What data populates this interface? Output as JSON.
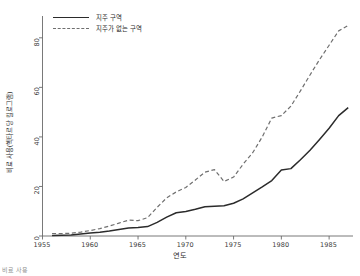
{
  "figure": {
    "background": "#ffffff",
    "footnote": "비료 사용"
  },
  "chart_data": {
    "type": "line",
    "title": "",
    "xlabel": "연도",
    "ylabel": "비료 사용(헥타르당 킬로그램)",
    "xlim": [
      1955,
      1987.5
    ],
    "ylim": [
      0,
      88
    ],
    "xticks": [
      "1955",
      "1960",
      "1965",
      "1970",
      "1975",
      "1980",
      "1985"
    ],
    "xtick_values": [
      1955,
      1960,
      1965,
      1970,
      1975,
      1980,
      1985
    ],
    "yticks": [
      "0",
      "20",
      "40",
      "60",
      "80"
    ],
    "ytick_values": [
      0,
      20,
      40,
      60,
      80
    ],
    "grid": false,
    "legend_position": "top-left",
    "x": [
      1956,
      1957,
      1958,
      1959,
      1960,
      1961,
      1962,
      1963,
      1964,
      1965,
      1966,
      1967,
      1968,
      1969,
      1970,
      1971,
      1972,
      1973,
      1974,
      1975,
      1976,
      1977,
      1978,
      1979,
      1980,
      1981,
      1982,
      1983,
      1984,
      1985,
      1986,
      1987
    ],
    "series": [
      {
        "name": "지주 구역",
        "style": "solid",
        "color": "#2b2b2b",
        "values": [
          0.2,
          0.3,
          0.4,
          0.8,
          1.2,
          1.5,
          2.0,
          2.6,
          3.2,
          3.4,
          3.8,
          5.5,
          7.6,
          9.4,
          9.9,
          10.8,
          11.8,
          12.0,
          12.2,
          13.2,
          15.0,
          17.4,
          19.8,
          22.4,
          26.6,
          27.2,
          30.8,
          34.6,
          39.0,
          43.5,
          48.6,
          51.8
        ]
      },
      {
        "name": "지주가 없는 구역",
        "style": "dashed",
        "color": "#6f6f6f",
        "values": [
          1.0,
          1.0,
          1.1,
          1.6,
          2.2,
          3.0,
          4.0,
          5.2,
          6.4,
          6.2,
          7.4,
          11.6,
          15.4,
          17.8,
          19.6,
          22.6,
          25.8,
          26.8,
          22.0,
          23.8,
          29.0,
          33.6,
          40.0,
          47.6,
          48.6,
          52.4,
          58.6,
          65.0,
          71.2,
          77.0,
          82.8,
          85.0
        ]
      }
    ]
  }
}
